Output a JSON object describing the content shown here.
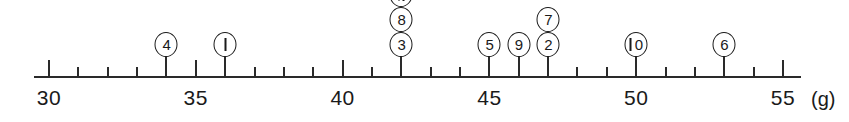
{
  "figure": {
    "kind": "number-line-dot-plot",
    "unit_label": "(g)"
  },
  "axis": {
    "min": 29.5,
    "max": 55.6,
    "major_ticks": [
      30,
      35,
      40,
      45,
      50,
      55
    ],
    "major_tick_labels": [
      "30",
      "35",
      "40",
      "45",
      "50",
      "55"
    ],
    "minor_tick_step": 1,
    "line_color": "#2a2a2a"
  },
  "markers": [
    {
      "label": "4",
      "value": 34,
      "height_index": 0,
      "digits": "4"
    },
    {
      "label": "1",
      "value": 36,
      "height_index": 0,
      "digits": "1"
    },
    {
      "label": "3",
      "value": 42,
      "height_index": 0,
      "digits": "3"
    },
    {
      "label": "8",
      "value": 42,
      "height_index": 1,
      "digits": "8"
    },
    {
      "label": "11",
      "value": 42,
      "height_index": 2,
      "digits": "11"
    },
    {
      "label": "5",
      "value": 45,
      "height_index": 0,
      "digits": "5"
    },
    {
      "label": "9",
      "value": 46,
      "height_index": 0,
      "digits": "9"
    },
    {
      "label": "2",
      "value": 47,
      "height_index": 0,
      "digits": "2"
    },
    {
      "label": "7",
      "value": 47,
      "height_index": 1,
      "digits": "7"
    },
    {
      "label": "10",
      "value": 50,
      "height_index": 0,
      "digits": "10"
    },
    {
      "label": "6",
      "value": 53,
      "height_index": 0,
      "digits": "6"
    }
  ],
  "chart_data": {
    "type": "scatter",
    "title": "",
    "subtitle": "",
    "xlabel": "(g)",
    "ylabel": "",
    "xlim": [
      29.5,
      55.6
    ],
    "grid": false,
    "legend": "none",
    "x_tick_labels": [
      "30",
      "35",
      "40",
      "45",
      "50",
      "55"
    ],
    "x_ticks_major": [
      30,
      35,
      40,
      45,
      50,
      55
    ],
    "x_ticks_minor_step": 1,
    "point_style": "circled-number",
    "points": [
      {
        "id": "4",
        "x": 34
      },
      {
        "id": "1",
        "x": 36
      },
      {
        "id": "3",
        "x": 42
      },
      {
        "id": "8",
        "x": 42
      },
      {
        "id": "11",
        "x": 42
      },
      {
        "id": "5",
        "x": 45
      },
      {
        "id": "9",
        "x": 46
      },
      {
        "id": "2",
        "x": 47
      },
      {
        "id": "7",
        "x": 47
      },
      {
        "id": "10",
        "x": 50
      },
      {
        "id": "6",
        "x": 53
      }
    ],
    "stacks": [
      {
        "x": 34,
        "ids": [
          "4"
        ]
      },
      {
        "x": 36,
        "ids": [
          "1"
        ]
      },
      {
        "x": 42,
        "ids": [
          "3",
          "8",
          "11"
        ]
      },
      {
        "x": 45,
        "ids": [
          "5"
        ]
      },
      {
        "x": 46,
        "ids": [
          "9"
        ]
      },
      {
        "x": 47,
        "ids": [
          "2",
          "7"
        ]
      },
      {
        "x": 50,
        "ids": [
          "10"
        ]
      },
      {
        "x": 53,
        "ids": [
          "6"
        ]
      }
    ]
  }
}
